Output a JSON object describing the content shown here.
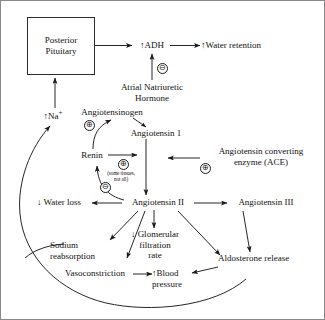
{
  "diagram": {
    "colors": {
      "ink": "#111111",
      "line": "#1a1a1a",
      "box_border": "#2b2b2b",
      "background": "#ffffff",
      "frame": "#8a8a8a"
    },
    "nodes": [
      {
        "id": "posterior_pituitary",
        "label": "Posterior\nPituitary",
        "line1": "Posterior",
        "line2": "Pituitary",
        "shape": "box"
      },
      {
        "id": "adh",
        "label": "↑ADH",
        "shape": "text"
      },
      {
        "id": "water_retention",
        "label": "↑Water retention",
        "shape": "text"
      },
      {
        "id": "atrial_natriuretic_hormone",
        "line1": "Atrial Natriuretic",
        "line2": "Hormone",
        "shape": "text"
      },
      {
        "id": "na_plus",
        "label": "↑Na",
        "sup": "+",
        "shape": "text"
      },
      {
        "id": "angiotensinogen",
        "label": "Angiotensinogen",
        "shape": "text"
      },
      {
        "id": "angiotensin_1",
        "label": "Angiotensin 1",
        "shape": "text"
      },
      {
        "id": "renin",
        "label": "Renin",
        "shape": "text"
      },
      {
        "id": "some_tissues",
        "line1": "(some tissues,",
        "line2": "not all)",
        "shape": "annotation"
      },
      {
        "id": "ace",
        "line1": "Angiotensin converting",
        "line2": "enzyme (ACE)",
        "shape": "text"
      },
      {
        "id": "angiotensin_2",
        "label": "Angiotensin II",
        "shape": "text"
      },
      {
        "id": "angiotensin_3",
        "label": "Angiotensin III",
        "shape": "text"
      },
      {
        "id": "water_loss",
        "label": "↓ Water loss",
        "shape": "text"
      },
      {
        "id": "gfr",
        "line1": "↓ Glomerular",
        "line2": "filtration",
        "line3": "rate",
        "shape": "text"
      },
      {
        "id": "sodium_reabsorption",
        "line1": "Sodium",
        "line2": "reabsorption",
        "shape": "text"
      },
      {
        "id": "vasoconstriction",
        "label": "Vasoconstriction",
        "shape": "text"
      },
      {
        "id": "blood_pressure",
        "line1": "↑Blood",
        "line2": "pressure",
        "shape": "text"
      },
      {
        "id": "aldosterone_release",
        "label": "Aldosterone release",
        "shape": "text"
      }
    ],
    "signs": [
      {
        "id": "sign-anh-inhibits-adh",
        "symbol": "⊖",
        "meaning": "negative"
      },
      {
        "id": "sign-renin-on-angiotensinogen",
        "symbol": "⊕",
        "meaning": "positive"
      },
      {
        "id": "sign-renin-to-angiotensin1",
        "symbol": "⊕",
        "meaning": "positive"
      },
      {
        "id": "sign-ace-positive",
        "symbol": "⊕",
        "meaning": "positive"
      },
      {
        "id": "sign-angiotensin2-inhibits-renin",
        "symbol": "⊖",
        "meaning": "negative"
      }
    ]
  }
}
